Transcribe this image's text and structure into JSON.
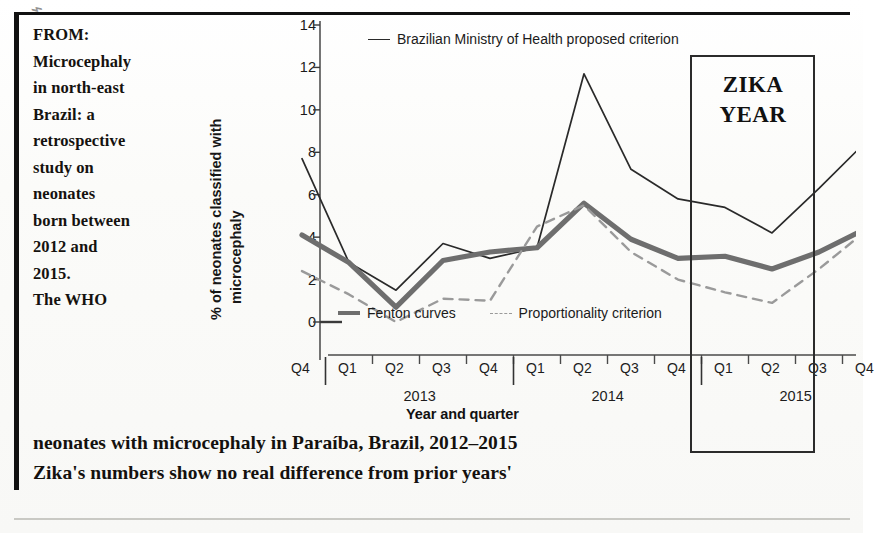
{
  "clipping": {
    "stray_mark": "⌁",
    "intro_lines": [
      "FROM:",
      "Microcephaly",
      "in north-east",
      "Brazil: a",
      "retrospective",
      "study on",
      "neonates",
      "born between",
      "2012 and",
      "2015.",
      "The WHO"
    ],
    "caption_lines": [
      "neonates with microcephaly in Paraíba, Brazil, 2012–2015",
      "Zika's numbers show no real difference from prior years'"
    ],
    "annotation": {
      "label_line1": "ZIKA",
      "label_line2": "YEAR"
    }
  },
  "chart_data": {
    "type": "line",
    "title": "",
    "xlabel": "Year and quarter",
    "ylabel_line1": "% of neonates classified with",
    "ylabel_line2": "microcephaly",
    "ylim": [
      0,
      14
    ],
    "yticks": [
      0,
      2,
      4,
      6,
      8,
      10,
      12,
      14
    ],
    "grid": false,
    "legend_position": "inside",
    "x": [
      "2012-Q4",
      "2013-Q1",
      "2013-Q2",
      "2013-Q3",
      "2013-Q4",
      "2014-Q1",
      "2014-Q2",
      "2014-Q3",
      "2014-Q4",
      "2015-Q1",
      "2015-Q2",
      "2015-Q3",
      "2015-Q4"
    ],
    "quarter_ticks": [
      "Q4",
      "Q1",
      "Q2",
      "Q3",
      "Q4",
      "Q1",
      "Q2",
      "Q3",
      "Q4",
      "Q1",
      "Q2",
      "Q3",
      "Q4"
    ],
    "year_groups": [
      {
        "label": "2013",
        "start": 1,
        "end": 4
      },
      {
        "label": "2014",
        "start": 5,
        "end": 8
      },
      {
        "label": "2015",
        "start": 9,
        "end": 12
      }
    ],
    "series": [
      {
        "name": "Brazilian Ministry of Health proposed criterion",
        "style": "solid-thin",
        "color": "#2a2a2a",
        "values": [
          7.7,
          2.8,
          1.5,
          3.7,
          3.0,
          3.5,
          11.7,
          7.2,
          5.8,
          5.4,
          4.2,
          6.3,
          8.5
        ]
      },
      {
        "name": "Fenton curves",
        "style": "solid-thick",
        "color": "#6e6e6e",
        "values": [
          4.1,
          2.8,
          0.7,
          2.9,
          3.3,
          3.5,
          5.6,
          3.9,
          3.0,
          3.1,
          2.5,
          3.3,
          4.4
        ]
      },
      {
        "name": "Proportionality criterion",
        "style": "dashed",
        "color": "#9a9a9a",
        "values": [
          2.4,
          1.3,
          0.0,
          1.1,
          1.0,
          4.5,
          5.5,
          3.3,
          2.0,
          1.4,
          0.9,
          2.5,
          4.3
        ]
      }
    ],
    "annotation_span": {
      "label": "ZIKA YEAR",
      "from": "2015-Q2",
      "to": "2015-Q4"
    }
  }
}
